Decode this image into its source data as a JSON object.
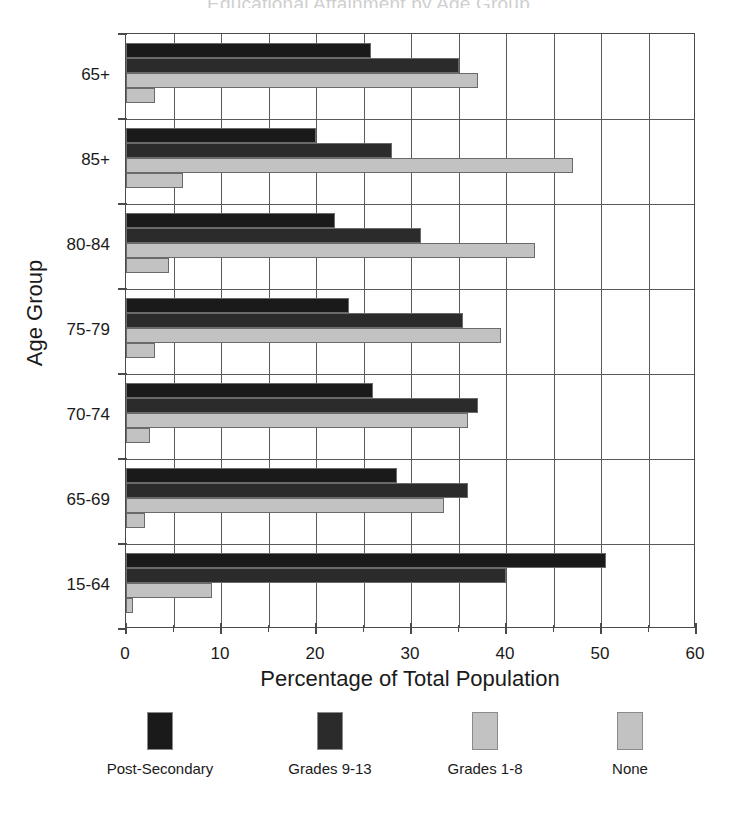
{
  "title_sliver": "Educational Attainment by Age Group",
  "chart_data": {
    "type": "bar",
    "orientation": "horizontal",
    "title": "",
    "xlabel": "Percentage of Total Population",
    "ylabel": "Age Group",
    "xlim": [
      0,
      60
    ],
    "xticks": [
      0,
      10,
      20,
      30,
      40,
      50,
      60
    ],
    "xtick_labels": [
      "0",
      "10",
      "20",
      "30",
      "40",
      "50",
      "60"
    ],
    "xminorticks": [
      5,
      15,
      25,
      35,
      45,
      55
    ],
    "grid": true,
    "legend_position": "bottom",
    "categories": [
      "65+",
      "85+",
      "80-84",
      "75-79",
      "70-74",
      "65-69",
      "15-64"
    ],
    "series": [
      {
        "name": "Post-Secondary",
        "color": "#1a1a1a",
        "values": [
          25.8,
          20.0,
          22.0,
          23.5,
          26.0,
          28.5,
          50.5
        ]
      },
      {
        "name": "Grades 9-13",
        "color": "#2b2b2b",
        "values": [
          35.0,
          28.0,
          31.0,
          35.5,
          37.0,
          36.0,
          40.0
        ]
      },
      {
        "name": "Grades 1-8",
        "color": "#c2c2c2",
        "values": [
          37.0,
          47.0,
          43.0,
          39.5,
          36.0,
          33.5,
          9.0
        ]
      },
      {
        "name": "None",
        "color": "#c2c2c2",
        "values": [
          3.0,
          6.0,
          4.5,
          3.0,
          2.5,
          2.0,
          0.7
        ]
      }
    ]
  },
  "legend": {
    "entries": [
      {
        "label": "Post-Secondary",
        "color": "#1a1a1a"
      },
      {
        "label": "Grades 9-13",
        "color": "#2b2b2b"
      },
      {
        "label": "Grades 1-8",
        "color": "#c2c2c2"
      },
      {
        "label": "None",
        "color": "#c2c2c2"
      }
    ]
  }
}
